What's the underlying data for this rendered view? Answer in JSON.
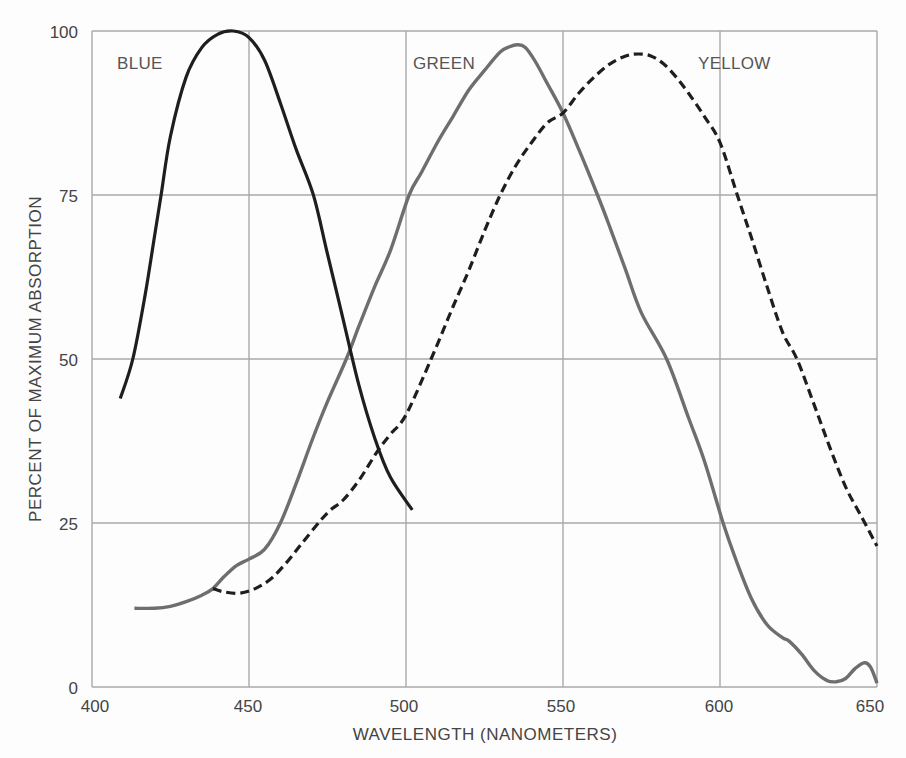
{
  "chart_data": {
    "type": "line",
    "title": "",
    "xlabel": "WAVELENGTH (NANOMETERS)",
    "ylabel": "PERCENT OF MAXIMUM ABSORPTION",
    "xlim": [
      400,
      650
    ],
    "ylim": [
      0,
      100
    ],
    "x_ticks": [
      400,
      450,
      500,
      550,
      600,
      650
    ],
    "y_ticks": [
      0,
      25,
      50,
      75,
      100
    ],
    "grid": true,
    "legend": "inline labels near curve peaks",
    "series": [
      {
        "name": "BLUE",
        "style": "solid",
        "color": "#1e1e1e",
        "x": [
          409,
          413,
          417,
          420,
          422,
          425,
          430,
          435,
          440,
          445,
          450,
          455,
          460,
          465,
          470.5,
          475,
          480,
          485,
          490,
          495,
          502
        ],
        "y": [
          44,
          50,
          60,
          69,
          75,
          84,
          93,
          97.5,
          99.5,
          100,
          99,
          95.5,
          89,
          82,
          75,
          66,
          56,
          46,
          38,
          32,
          27
        ]
      },
      {
        "name": "GREEN",
        "style": "solid",
        "color": "#6e6e6e",
        "x": [
          413.5,
          420,
          425,
          430,
          435,
          438.5,
          442,
          446,
          450,
          455,
          460,
          465,
          470,
          475,
          481,
          485,
          490,
          495,
          501,
          505,
          510,
          515,
          520,
          525,
          530,
          533,
          535.5,
          538,
          541,
          545,
          550,
          555,
          561,
          565,
          570,
          575,
          583,
          590,
          595,
          601,
          605,
          610,
          615,
          620,
          622,
          626,
          630,
          634,
          637,
          640,
          643,
          646,
          648,
          650
        ],
        "y": [
          12,
          12,
          12.3,
          13,
          14,
          15,
          16.8,
          18.5,
          19.5,
          21,
          25,
          31,
          37.5,
          43.5,
          50,
          55,
          61,
          66.5,
          75,
          78.5,
          83,
          87,
          91,
          94,
          96.8,
          97.6,
          97.9,
          97.5,
          95.5,
          92,
          87.5,
          82,
          75,
          70,
          63.5,
          57,
          50,
          41,
          34.5,
          25,
          19.5,
          13.5,
          9.5,
          7.5,
          7,
          5,
          2.5,
          1,
          0.8,
          1.3,
          2.8,
          3.7,
          3,
          0.6
        ]
      },
      {
        "name": "YELLOW",
        "style": "dashed",
        "color": "#1e1e1e",
        "x": [
          438.5,
          442,
          447,
          452,
          457,
          462,
          467,
          473,
          476,
          480,
          485,
          491,
          495,
          500,
          508,
          515,
          520,
          525,
          530,
          535,
          540,
          545,
          550,
          555,
          560,
          565,
          570,
          574,
          578,
          582,
          586,
          590,
          595,
          600,
          605.5,
          610,
          615,
          620,
          624.5,
          630,
          635,
          640,
          645,
          650
        ],
        "y": [
          15,
          14.5,
          14.3,
          15,
          16.5,
          19,
          22,
          25.5,
          27,
          28.5,
          31.5,
          36,
          38.5,
          41.5,
          50,
          58,
          63.5,
          69.5,
          75,
          79.5,
          83,
          86,
          87.5,
          90.5,
          93,
          95,
          96.2,
          96.5,
          96.2,
          95,
          93,
          90.5,
          87,
          83,
          75,
          68.5,
          61,
          54,
          50,
          43,
          36.5,
          30.5,
          26,
          21.5
        ]
      }
    ]
  },
  "labels": {
    "x_axis_title": "WAVELENGTH (NANOMETERS)",
    "y_axis_title": "PERCENT OF MAXIMUM ABSORPTION",
    "series_blue": "BLUE",
    "series_green": "GREEN",
    "series_yellow": "YELLOW",
    "x_ticks": [
      "400",
      "450",
      "500",
      "550",
      "600",
      "650"
    ],
    "y_ticks": [
      "0",
      "25",
      "50",
      "75",
      "100"
    ]
  },
  "colors": {
    "background": "#fdfdfd",
    "grid": "#a8a8a8",
    "text": "#444444",
    "blue_curve": "#1e1e1e",
    "green_curve": "#6e6e6e",
    "yellow_curve": "#1e1e1e"
  }
}
